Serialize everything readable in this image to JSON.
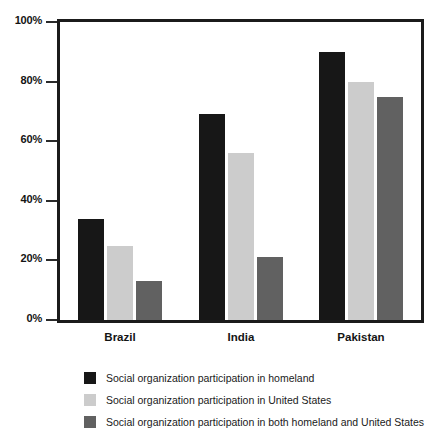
{
  "chart_data": {
    "type": "bar",
    "title": "",
    "xlabel": "",
    "ylabel": "",
    "categories": [
      "Brazil",
      "India",
      "Pakistan"
    ],
    "series": [
      {
        "name": "Social organization participation in homeland",
        "color": "#171717",
        "values": [
          34,
          69,
          90
        ]
      },
      {
        "name": "Social organization participation in United States",
        "color": "#cccccc",
        "values": [
          25,
          56,
          80
        ]
      },
      {
        "name": "Social organization participation in both homeland and United States",
        "color": "#616161",
        "values": [
          13,
          21,
          75
        ]
      }
    ],
    "ylim": [
      0,
      100
    ],
    "yticks": [
      0,
      20,
      40,
      60,
      80,
      100
    ],
    "ytick_labels": [
      "0%",
      "20%",
      "40%",
      "60%",
      "80%",
      "100%"
    ],
    "grid": false,
    "legend_position": "bottom-left",
    "axis_color": "#1b1b1b",
    "background": "#ffffff"
  },
  "legend": {
    "items": [
      {
        "label": "Social organization participation in homeland",
        "color": "#171717"
      },
      {
        "label": "Social organization participation in United States",
        "color": "#cccccc"
      },
      {
        "label": "Social organization participation in both homeland and United States",
        "color": "#616161"
      }
    ]
  }
}
